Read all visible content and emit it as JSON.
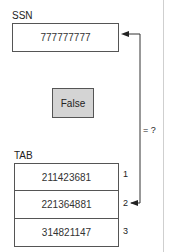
{
  "ssn": {
    "label": "SSN",
    "value": "777777777"
  },
  "result": {
    "label": "False"
  },
  "compare": {
    "label": "= ?"
  },
  "tab": {
    "label": "TAB",
    "rows": [
      {
        "value": "211423681",
        "index": "1"
      },
      {
        "value": "221364881",
        "index": "2"
      },
      {
        "value": "314821147",
        "index": "3"
      }
    ]
  },
  "colors": {
    "result_fill": "#d4d4d4",
    "stroke": "#555555"
  }
}
